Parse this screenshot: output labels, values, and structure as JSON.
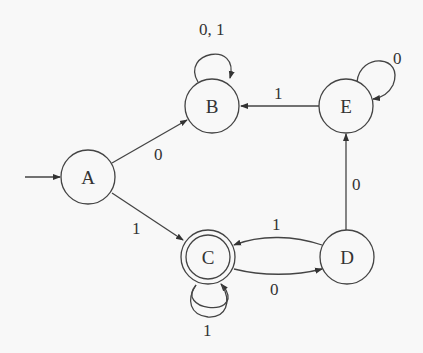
{
  "diagram": {
    "type": "DFA",
    "start_state": "A",
    "accept_states": [
      "C"
    ],
    "nodes": [
      {
        "id": "A",
        "label": "A",
        "x": 88,
        "y": 177,
        "accepting": false
      },
      {
        "id": "B",
        "label": "B",
        "x": 212,
        "y": 106,
        "accepting": false
      },
      {
        "id": "C",
        "label": "C",
        "x": 208,
        "y": 257,
        "accepting": true
      },
      {
        "id": "D",
        "label": "D",
        "x": 347,
        "y": 257,
        "accepting": false
      },
      {
        "id": "E",
        "label": "E",
        "x": 346,
        "y": 106,
        "accepting": false
      }
    ],
    "edges": [
      {
        "from": "A",
        "to": "B",
        "label": "0"
      },
      {
        "from": "A",
        "to": "C",
        "label": "1"
      },
      {
        "from": "B",
        "to": "B",
        "label": "0, 1"
      },
      {
        "from": "C",
        "to": "C",
        "label": "1"
      },
      {
        "from": "C",
        "to": "D",
        "label": "0"
      },
      {
        "from": "D",
        "to": "C",
        "label": "1"
      },
      {
        "from": "D",
        "to": "E",
        "label": "0"
      },
      {
        "from": "E",
        "to": "B",
        "label": "1"
      },
      {
        "from": "E",
        "to": "E",
        "label": "0"
      }
    ]
  }
}
